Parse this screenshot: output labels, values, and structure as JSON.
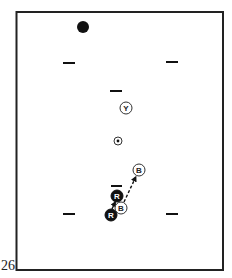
{
  "page": {
    "number": "26"
  },
  "diagram": {
    "type": "play-diagram",
    "court": {
      "x": 16,
      "y": 12,
      "width": 207,
      "height": 258,
      "stroke": "#222222"
    },
    "ball": {
      "x": 83,
      "y": 27,
      "r": 6,
      "fill": "#111111"
    },
    "markers": [
      {
        "name": "dash-top-left",
        "x1": 63,
        "x2": 75,
        "y": 63
      },
      {
        "name": "dash-top-right",
        "x1": 166,
        "x2": 178,
        "y": 62
      },
      {
        "name": "dash-center",
        "x1": 110,
        "x2": 122,
        "y": 91
      },
      {
        "name": "dash-above-r",
        "x1": 111,
        "x2": 122,
        "y": 186
      },
      {
        "name": "dash-bottom-left",
        "x1": 63,
        "x2": 75,
        "y": 214
      },
      {
        "name": "dash-bottom-right",
        "x1": 166,
        "x2": 178,
        "y": 214
      }
    ],
    "players": [
      {
        "name": "player-y",
        "label": "Y",
        "x": 126,
        "y": 108,
        "style": "outline"
      },
      {
        "name": "player-b-upper",
        "label": "B",
        "x": 139,
        "y": 170,
        "style": "outline"
      },
      {
        "name": "player-r-upper",
        "label": "R",
        "x": 117,
        "y": 196,
        "style": "filled"
      },
      {
        "name": "player-b-lower",
        "label": "B",
        "x": 121,
        "y": 208,
        "style": "outline"
      },
      {
        "name": "player-r-lower",
        "label": "R",
        "x": 111,
        "y": 215,
        "style": "filled"
      }
    ],
    "target": {
      "x": 118,
      "y": 141,
      "r": 4
    },
    "arrows": [
      {
        "name": "arrow-r-to-r",
        "from": [
          112,
          209
        ],
        "to": [
          115,
          202
        ],
        "style": "solid"
      },
      {
        "name": "arrow-b-to-b",
        "from": [
          124,
          202
        ],
        "to": [
          136,
          177
        ],
        "style": "dashed"
      }
    ]
  }
}
